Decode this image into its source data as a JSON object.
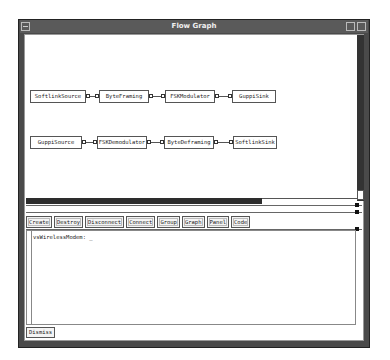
{
  "window": {
    "title": "Flow Graph"
  },
  "graph": {
    "nodes": [
      {
        "id": "softlinksource",
        "label": "SoftlinkSource"
      },
      {
        "id": "byteframing",
        "label": "ByteFraming"
      },
      {
        "id": "fskmodulator",
        "label": "FSKModulator"
      },
      {
        "id": "guppisink",
        "label": "GuppiSink"
      },
      {
        "id": "guppisource",
        "label": "GuppiSource"
      },
      {
        "id": "fskdemodulator",
        "label": "FSKDemodulator"
      },
      {
        "id": "bytedeframing",
        "label": "ByteDeframing"
      },
      {
        "id": "softlinksink",
        "label": "SoftlinkSink"
      }
    ],
    "edges": [
      [
        "SoftlinkSource",
        "ByteFraming"
      ],
      [
        "ByteFraming",
        "FSKModulator"
      ],
      [
        "FSKModulator",
        "GuppiSink"
      ],
      [
        "GuppiSource",
        "FSKDemodulator"
      ],
      [
        "FSKDemodulator",
        "ByteDeframing"
      ],
      [
        "ByteDeframing",
        "SoftlinkSink"
      ]
    ]
  },
  "toolbar": {
    "buttons": [
      "Create",
      "Destroy",
      "Disconnect",
      "Connect",
      "Group",
      "Graph",
      "Panel",
      "Code"
    ]
  },
  "console": {
    "text": "vsWirelessModem: _"
  },
  "footer": {
    "dismiss_label": "Dismiss"
  }
}
